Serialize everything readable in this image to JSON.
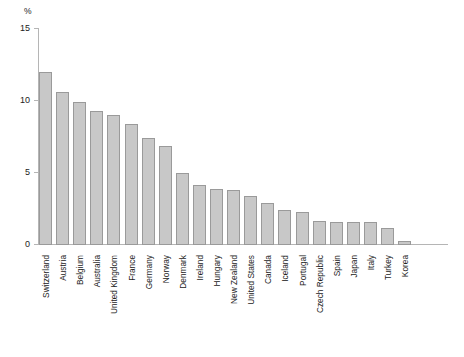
{
  "chart_data": {
    "type": "bar",
    "title": "",
    "subtitle": "",
    "xlabel": "",
    "ylabel": "",
    "unit_label": "%",
    "ylim": [
      0,
      15
    ],
    "yticks": [
      0,
      5,
      10,
      15
    ],
    "ytick_labels": [
      "0",
      "5",
      "10",
      "15"
    ],
    "grid": false,
    "legend": false,
    "legend_position": "none",
    "orientation": "vertical",
    "bar_color": "#c8c8c8",
    "bar_border_color": "#9a9a9a",
    "axis_color": "#b5b5b5",
    "text_color": "#222222",
    "categories": [
      "Switzerland",
      "Austria",
      "Belgium",
      "Australia",
      "United Kingdom",
      "France",
      "Germany",
      "Norway",
      "Denmark",
      "Ireland",
      "Hungary",
      "New Zealand",
      "United States",
      "Canada",
      "Iceland",
      "Portugal",
      "Czech Republic",
      "Spain",
      "Japan",
      "Italy",
      "Turkey",
      "Korea"
    ],
    "values": [
      12.0,
      10.6,
      9.9,
      9.3,
      9.0,
      8.4,
      7.4,
      6.9,
      5.0,
      4.2,
      3.9,
      3.8,
      3.4,
      2.9,
      2.4,
      2.3,
      1.7,
      1.6,
      1.6,
      1.6,
      1.2,
      0.3
    ]
  }
}
